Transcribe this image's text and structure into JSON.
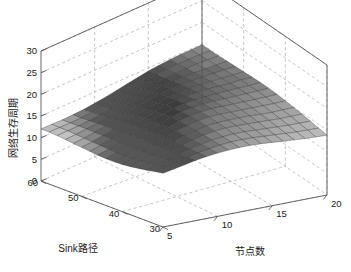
{
  "figure": {
    "kind": "matlab-3d-surface-plot",
    "background_color": "#ffffff",
    "axis_line_color": "#555555",
    "grid_color": "#b9b9b9",
    "text_color": "#1a1a1a",
    "surface_mesh_color": "#2b2b2b",
    "surface_face_light": "#e8e8e8",
    "surface_face_dark": "#1c1c1c"
  },
  "chart_data": {
    "type": "surface",
    "title": "",
    "xlabel": "节点数",
    "ylabel": "Sink路径",
    "zlabel": "网络生存周期",
    "xlim": [
      5,
      20
    ],
    "ylim": [
      30,
      60
    ],
    "zlim": [
      0,
      30
    ],
    "xticks": [
      5,
      10,
      15,
      20
    ],
    "yticks": [
      30,
      40,
      50,
      60
    ],
    "zticks": [
      0,
      5,
      10,
      15,
      20,
      25,
      30
    ],
    "xtick_labels": [
      "5",
      "10",
      "15",
      "20"
    ],
    "ytick_labels": [
      "30",
      "40",
      "50",
      "60"
    ],
    "ztick_labels": [
      "0",
      "5",
      "10",
      "15",
      "20",
      "25",
      "30"
    ],
    "grid": true,
    "legend": null,
    "x": [
      5,
      6,
      7,
      8,
      9,
      10,
      11,
      12,
      13,
      14,
      15,
      16,
      17,
      18,
      19,
      20
    ],
    "y": [
      30,
      32,
      34,
      36,
      38,
      40,
      42,
      44,
      46,
      48,
      50,
      52,
      54,
      56,
      58,
      60
    ],
    "z": [
      [
        12.4,
        12.9,
        13.4,
        13.9,
        14.3,
        14.6,
        14.8,
        14.9,
        14.9,
        14.8,
        14.6,
        14.4,
        14.2,
        14.0,
        13.9,
        13.8
      ],
      [
        12.1,
        12.6,
        13.2,
        13.8,
        14.3,
        14.7,
        15.0,
        15.2,
        15.2,
        15.1,
        14.9,
        14.7,
        14.5,
        14.3,
        14.2,
        14.1
      ],
      [
        11.7,
        12.3,
        13.0,
        13.7,
        14.3,
        14.8,
        15.2,
        15.4,
        15.5,
        15.4,
        15.2,
        15.0,
        14.8,
        14.6,
        14.5,
        14.4
      ],
      [
        11.4,
        12.0,
        12.8,
        13.6,
        14.3,
        14.9,
        15.4,
        15.7,
        15.8,
        15.7,
        15.5,
        15.3,
        15.1,
        14.9,
        14.8,
        14.7
      ],
      [
        11.1,
        11.8,
        12.6,
        13.5,
        14.3,
        15.0,
        15.5,
        15.9,
        16.0,
        15.9,
        15.8,
        15.6,
        15.3,
        15.1,
        15.0,
        14.9
      ],
      [
        10.9,
        11.6,
        12.5,
        13.4,
        14.3,
        15.1,
        15.7,
        16.1,
        16.3,
        16.2,
        16.0,
        15.8,
        15.6,
        15.4,
        15.2,
        15.1
      ],
      [
        10.8,
        11.5,
        12.4,
        13.4,
        14.3,
        15.1,
        15.8,
        16.2,
        16.4,
        16.4,
        16.2,
        16.0,
        15.8,
        15.6,
        15.4,
        15.3
      ],
      [
        10.8,
        11.5,
        12.4,
        13.3,
        14.2,
        15.0,
        15.7,
        16.2,
        16.4,
        16.4,
        16.3,
        16.1,
        15.9,
        15.7,
        15.5,
        15.4
      ],
      [
        10.9,
        11.5,
        12.3,
        13.2,
        14.0,
        14.8,
        15.5,
        16.0,
        16.3,
        16.3,
        16.2,
        16.1,
        15.9,
        15.7,
        15.5,
        15.4
      ],
      [
        11.1,
        11.6,
        12.3,
        13.0,
        13.8,
        14.5,
        15.2,
        15.7,
        16.0,
        16.1,
        16.1,
        16.0,
        15.8,
        15.6,
        15.5,
        15.3
      ],
      [
        11.3,
        11.7,
        12.2,
        12.8,
        13.5,
        14.2,
        14.8,
        15.3,
        15.7,
        15.8,
        15.9,
        15.8,
        15.7,
        15.5,
        15.4,
        15.2
      ],
      [
        11.5,
        11.8,
        12.2,
        12.7,
        13.2,
        13.8,
        14.4,
        14.9,
        15.3,
        15.5,
        15.6,
        15.6,
        15.5,
        15.4,
        15.3,
        15.1
      ],
      [
        11.7,
        11.9,
        12.2,
        12.5,
        12.9,
        13.4,
        13.9,
        14.4,
        14.8,
        15.1,
        15.3,
        15.3,
        15.3,
        15.2,
        15.1,
        15.0
      ],
      [
        11.9,
        12.0,
        12.1,
        12.3,
        12.6,
        13.0,
        13.5,
        13.9,
        14.4,
        14.7,
        14.9,
        15.0,
        15.1,
        15.1,
        15.0,
        14.9
      ],
      [
        12.0,
        12.0,
        12.0,
        12.1,
        12.4,
        12.7,
        13.1,
        13.5,
        13.9,
        14.3,
        14.6,
        14.8,
        14.9,
        14.9,
        14.9,
        14.8
      ],
      [
        12.0,
        12.0,
        11.9,
        12.0,
        12.1,
        12.4,
        12.7,
        13.1,
        13.5,
        13.9,
        14.3,
        14.5,
        14.7,
        14.8,
        14.8,
        14.8
      ]
    ]
  },
  "axes": {
    "z_axis": {
      "name": "网络生存周期",
      "ticks": [
        "30",
        "25",
        "20",
        "15",
        "10",
        "5",
        "0"
      ]
    },
    "y_axis": {
      "name": "Sink路径",
      "ticks": [
        "60",
        "50",
        "40",
        "30"
      ]
    },
    "x_axis": {
      "name": "节点数",
      "ticks": [
        "5",
        "10",
        "15",
        "20"
      ]
    }
  }
}
